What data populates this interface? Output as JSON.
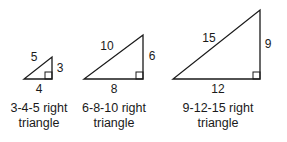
{
  "triangles": [
    {
      "id": "3-4-5",
      "hypotenuse": "5",
      "vertical_leg": "3",
      "base": "4",
      "caption_line1": "3-4-5 right",
      "caption_line2": "triangle",
      "points": {
        "left": [
          24,
          79
        ],
        "right": [
          52,
          79
        ],
        "top": [
          52,
          57
        ]
      }
    },
    {
      "id": "6-8-10",
      "hypotenuse": "10",
      "vertical_leg": "6",
      "base": "8",
      "caption_line1": "6-8-10 right",
      "caption_line2": "triangle",
      "points": {
        "left": [
          84,
          79
        ],
        "right": [
          143,
          79
        ],
        "top": [
          143,
          35
        ]
      }
    },
    {
      "id": "9-12-15",
      "hypotenuse": "15",
      "vertical_leg": "9",
      "base": "12",
      "caption_line1": "9-12-15 right",
      "caption_line2": "triangle",
      "points": {
        "left": [
          173,
          79
        ],
        "right": [
          260,
          79
        ],
        "top": [
          260,
          10
        ]
      }
    }
  ],
  "colors": {
    "stroke": "#1a1a1a",
    "background": "#ffffff"
  }
}
